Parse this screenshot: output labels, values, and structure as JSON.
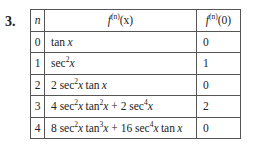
{
  "problem_number": "3.",
  "table": {
    "headers": {
      "n": "n",
      "f_prefix": "f",
      "f_sup": "(n)",
      "fx_arg": "(x)",
      "f0_arg": "(0)"
    },
    "rows": [
      {
        "n": "0",
        "value": "0"
      },
      {
        "n": "1",
        "value": "1"
      },
      {
        "n": "2",
        "value": "0"
      },
      {
        "n": "3",
        "value": "2"
      },
      {
        "n": "4",
        "value": "0"
      }
    ],
    "expr": {
      "tan": "tan",
      "sec": "sec",
      "x": "x",
      "plus": " + ",
      "sq": "2",
      "cube": "3",
      "four": "4",
      "c2": "2 ",
      "c4": "4 ",
      "c8": "8 ",
      "c16": "16 ",
      "sp": " "
    }
  }
}
